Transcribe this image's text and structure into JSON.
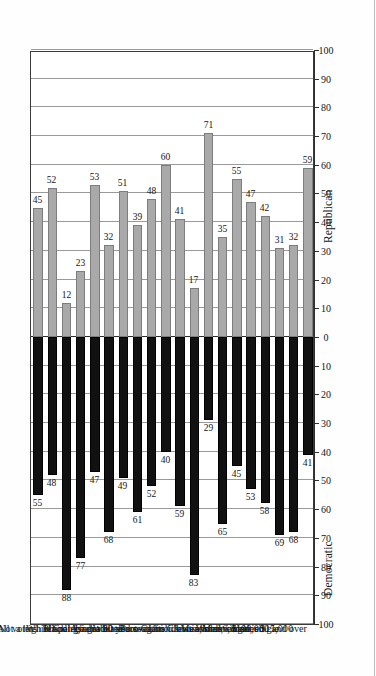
{
  "chart_data": {
    "type": "bar",
    "title": "",
    "orientation": "horizontal-diverging",
    "xlabel": "",
    "ylabel": "",
    "axis_left_title": "Democratic",
    "axis_right_title": "Republican",
    "tick_labels": [
      "100",
      "90",
      "80",
      "70",
      "60",
      "50",
      "40",
      "30",
      "20",
      "10",
      "0",
      "10",
      "20",
      "30",
      "40",
      "50",
      "60",
      "70",
      "80",
      "90",
      "100"
    ],
    "tick_values": [
      -100,
      -90,
      -80,
      -70,
      -60,
      -50,
      -40,
      -30,
      -20,
      -10,
      0,
      10,
      20,
      30,
      40,
      50,
      60,
      70,
      80,
      90,
      100
    ],
    "xlim": [
      -100,
      100
    ],
    "grid": true,
    "legend": "none",
    "colors": {
      "democratic": "#111111",
      "republican": "#a9a9a9",
      "frame": "#3a3a3a",
      "grid": "#9a9a9a"
    },
    "categories": [
      "All voters",
      "White",
      "Black",
      "Hispanic",
      "Asian",
      "Not a high school graduate",
      "College graduate",
      "Under 30 years",
      "60 and over",
      "White Protestants",
      "Catholics",
      "Jews",
      "Born-again Christians",
      "Union households",
      "Men, married",
      "Men, single",
      "Women, married",
      "Women, single",
      "Under $15,000",
      "$100,000 and over"
    ],
    "series": [
      {
        "name": "Democratic",
        "values": [
          55,
          48,
          88,
          77,
          47,
          68,
          49,
          61,
          52,
          40,
          59,
          83,
          29,
          65,
          45,
          53,
          58,
          69,
          68,
          41
        ]
      },
      {
        "name": "Republican",
        "values": [
          45,
          52,
          12,
          23,
          53,
          32,
          51,
          39,
          48,
          60,
          41,
          17,
          71,
          35,
          55,
          47,
          42,
          31,
          32,
          59
        ]
      }
    ],
    "groups": [
      {
        "label": "Race:",
        "start": 1,
        "count": 4
      },
      {
        "label": "Education:",
        "start": 5,
        "count": 2
      },
      {
        "label": "Age:",
        "start": 7,
        "count": 2
      },
      {
        "label": "Religion:",
        "start": 9,
        "count": 3
      },
      {
        "label": "Labor ties:",
        "start": 13,
        "count": 1
      },
      {
        "label": "Sex:",
        "start": 14,
        "count": 4
      },
      {
        "label": "Income:",
        "start": 18,
        "count": 2
      }
    ]
  }
}
